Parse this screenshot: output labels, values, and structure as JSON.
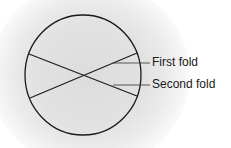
{
  "diagram": {
    "labels": {
      "first_fold": "First fold",
      "second_fold": "Second fold"
    },
    "colors": {
      "stroke": "#1a1a1a",
      "background_glow": "#dcdcdc"
    }
  }
}
